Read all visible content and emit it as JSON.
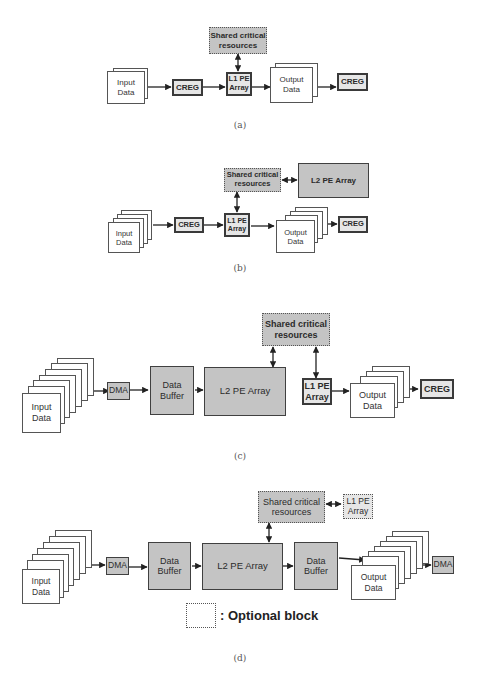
{
  "figure": {
    "subfigures": [
      {
        "caption": "(a)",
        "blocks": {
          "shared": "Shared critical\nresources",
          "input": "Input\nData",
          "creg_in": "CREG",
          "l1": "L1 PE\nArray",
          "output": "Output\nData",
          "creg_out": "CREG"
        }
      },
      {
        "caption": "(b)",
        "blocks": {
          "shared": "Shared critical\nresources",
          "l2": "L2 PE Array",
          "input": "Input\nData",
          "creg_in": "CREG",
          "l1": "L1 PE\nArray",
          "output": "Output\nData",
          "creg_out": "CREG"
        }
      },
      {
        "caption": "(c)",
        "blocks": {
          "shared": "Shared critical\nresources",
          "input": "Input\nData",
          "dma": "DMA",
          "buffer": "Data\nBuffer",
          "l2": "L2 PE Array",
          "l1": "L1 PE\nArray",
          "output": "Output\nData",
          "creg": "CREG"
        }
      },
      {
        "caption": "(d)",
        "blocks": {
          "shared": "Shared critical\nresources",
          "l1": "L1 PE\nArray",
          "input": "Input\nData",
          "dma_in": "DMA",
          "buffer_in": "Data\nBuffer",
          "l2": "L2 PE Array",
          "buffer_out": "Data\nBuffer",
          "output": "Output\nData",
          "dma_out": "DMA"
        },
        "legend": ": Optional block"
      }
    ]
  },
  "colors": {
    "gray_block": "#c4c4c4",
    "light_block": "#e6e6e6",
    "border": "#404040"
  }
}
